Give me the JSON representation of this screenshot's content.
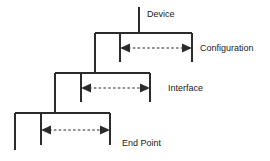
{
  "diagram": {
    "background_color": "#ffffff",
    "line_color": "#2b2b2b",
    "text_color": "#1a1a1a",
    "levels": [
      {
        "id": "device",
        "label": "Device",
        "has_span_arrow": false,
        "stem": {
          "x": 139,
          "y1": 7,
          "y2": 33
        },
        "label_pos": {
          "x": 147,
          "y": 17
        }
      },
      {
        "id": "configuration",
        "label": "Configuration",
        "has_span_arrow": true,
        "top_rule": {
          "x1": 95,
          "x2": 192,
          "y": 33
        },
        "left_vertical": {
          "x": 95,
          "y1": 33,
          "y2": 73
        },
        "inner_vertical": {
          "x": 120,
          "y1": 33,
          "y2": 62
        },
        "right_vertical": {
          "x": 192,
          "y1": 33,
          "y2": 62
        },
        "arrow": {
          "x1": 120,
          "x2": 192,
          "y": 48
        },
        "label_pos": {
          "x": 200,
          "y": 51
        }
      },
      {
        "id": "interface",
        "label": "Interface",
        "has_span_arrow": true,
        "top_rule": {
          "x1": 55,
          "x2": 150,
          "y": 73
        },
        "left_vertical": {
          "x": 55,
          "y1": 73,
          "y2": 113
        },
        "inner_vertical": {
          "x": 81,
          "y1": 73,
          "y2": 102
        },
        "right_vertical": {
          "x": 150,
          "y1": 73,
          "y2": 102
        },
        "arrow": {
          "x1": 81,
          "x2": 150,
          "y": 88
        },
        "label_pos": {
          "x": 168,
          "y": 91
        }
      },
      {
        "id": "end-point",
        "label": "End Point",
        "has_span_arrow": true,
        "top_rule": {
          "x1": 15,
          "x2": 110,
          "y": 113
        },
        "left_vertical": {
          "x": 15,
          "y1": 113,
          "y2": 150
        },
        "inner_vertical": {
          "x": 41,
          "y1": 113,
          "y2": 145
        },
        "right_vertical": {
          "x": 110,
          "y1": 113,
          "y2": 145
        },
        "arrow": {
          "x1": 41,
          "x2": 110,
          "y": 130
        },
        "label_pos": {
          "x": 122,
          "y": 146
        }
      }
    ]
  }
}
